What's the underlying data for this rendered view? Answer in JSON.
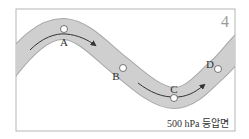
{
  "diagram": {
    "corner_number": "4",
    "caption": "500 hPa 등압면",
    "colors": {
      "band_fill": "#cfcfcf",
      "band_edge": "#a8a8a8",
      "frame": "#b5b5b5",
      "arrow": "#333333",
      "text": "#333333"
    },
    "points": [
      {
        "id": "A",
        "label": "A"
      },
      {
        "id": "B",
        "label": "B"
      },
      {
        "id": "C",
        "label": "C"
      },
      {
        "id": "D",
        "label": "D"
      }
    ]
  }
}
